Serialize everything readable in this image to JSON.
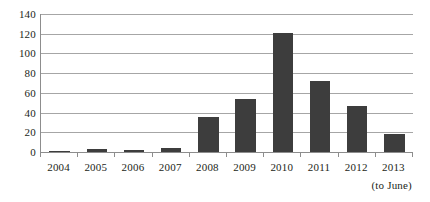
{
  "chart_data": {
    "type": "bar",
    "title": "",
    "subtitle": "",
    "xlabel": "",
    "ylabel": "",
    "categories": [
      "2004",
      "2005",
      "2006",
      "2007",
      "2008",
      "2009",
      "2010",
      "2011",
      "2012",
      "2013"
    ],
    "values": [
      1,
      3,
      2,
      4,
      36,
      54,
      121,
      72,
      47,
      18
    ],
    "series": [
      {
        "name": "count",
        "values": [
          1,
          3,
          2,
          4,
          36,
          54,
          121,
          72,
          47,
          18
        ]
      }
    ],
    "ylim": [
      0,
      140
    ],
    "yticks": [
      0,
      20,
      40,
      60,
      80,
      100,
      120,
      140
    ],
    "ytick_labels": [
      "0",
      "20",
      "40",
      "60",
      "80",
      "100",
      "120",
      "140"
    ],
    "grid": true,
    "legend": false,
    "legend_position": "none",
    "annotations": [
      {
        "text": "(to June)",
        "attached_to_category": "2013"
      }
    ],
    "colors": {
      "bar": "#3d3d3d",
      "gridline": "#a6a6a6",
      "axis": "#8d8d8d",
      "text": "#231f20",
      "background": "#ffffff"
    }
  }
}
